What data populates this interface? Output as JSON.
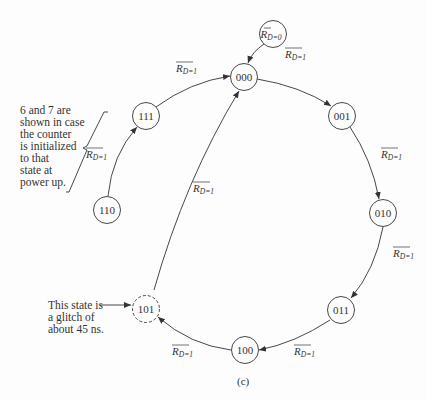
{
  "diagram": {
    "type": "state-diagram",
    "caption": "(c)",
    "states": [
      {
        "id": "s000",
        "label": "000",
        "cx": 244,
        "cy": 77,
        "dashed": false
      },
      {
        "id": "s001",
        "label": "001",
        "cx": 342,
        "cy": 116,
        "dashed": false
      },
      {
        "id": "s010",
        "label": "010",
        "cx": 383,
        "cy": 213,
        "dashed": false
      },
      {
        "id": "s011",
        "label": "011",
        "cx": 341,
        "cy": 310,
        "dashed": false
      },
      {
        "id": "s100",
        "label": "100",
        "cx": 245,
        "cy": 350,
        "dashed": false
      },
      {
        "id": "s101",
        "label": "101",
        "cx": 146,
        "cy": 309,
        "dashed": true
      },
      {
        "id": "s110",
        "label": "110",
        "cx": 107,
        "cy": 210,
        "dashed": false
      },
      {
        "id": "s111",
        "label": "111",
        "cx": 146,
        "cy": 116,
        "dashed": false
      },
      {
        "id": "reset",
        "label": "R",
        "sub": "D=0",
        "cx": 273,
        "cy": 34,
        "dashed": false
      }
    ],
    "edges": [
      {
        "from": "reset",
        "to": "s000",
        "label": ""
      },
      {
        "from": "s000",
        "to": "s001",
        "label": "R",
        "sub": "D=1"
      },
      {
        "from": "s001",
        "to": "s010",
        "label": "R",
        "sub": "D=1"
      },
      {
        "from": "s010",
        "to": "s011",
        "label": "R",
        "sub": "D=1"
      },
      {
        "from": "s011",
        "to": "s100",
        "label": "R",
        "sub": "D=1"
      },
      {
        "from": "s100",
        "to": "s101",
        "label": "R",
        "sub": "D=1"
      },
      {
        "from": "s101",
        "to": "s000",
        "label": "R",
        "sub": "D=1"
      },
      {
        "from": "s110",
        "to": "s111",
        "label": "R",
        "sub": "D=1"
      },
      {
        "from": "s111",
        "to": "s000",
        "label": "R",
        "sub": "D=1"
      }
    ],
    "edge_label_base": "R",
    "edge_label_sub_1": "D=1",
    "edge_label_sub_0": "D=0",
    "annotations": {
      "power_up_note": [
        "6 and 7 are",
        "shown in case",
        "the counter",
        "is initialized",
        "to that",
        "state at",
        "power up."
      ],
      "glitch_note": [
        "This state is",
        "a glitch of",
        "about 45 ns."
      ]
    }
  }
}
